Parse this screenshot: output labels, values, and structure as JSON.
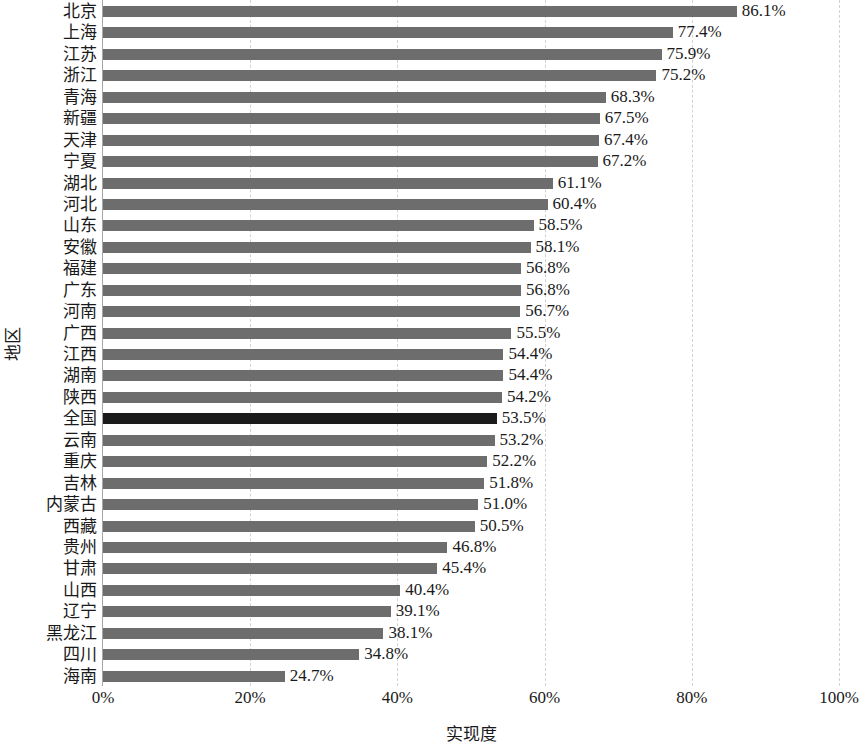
{
  "chart_data": {
    "type": "bar",
    "orientation": "horizontal",
    "title": "",
    "xlabel": "实现度",
    "ylabel": "地区",
    "xlim": [
      0,
      100
    ],
    "xticks": [
      "0%",
      "20%",
      "40%",
      "60%",
      "80%",
      "100%"
    ],
    "xtick_values": [
      0,
      20,
      40,
      60,
      80,
      100
    ],
    "grid": "vertical-dashed",
    "legend": null,
    "value_suffix": "%",
    "bar_color": "#6d6d6d",
    "highlight_color": "#1b1b1b",
    "highlight_category": "全国",
    "categories": [
      "北京",
      "上海",
      "江苏",
      "浙江",
      "青海",
      "新疆",
      "天津",
      "宁夏",
      "湖北",
      "河北",
      "山东",
      "安徽",
      "福建",
      "广东",
      "河南",
      "广西",
      "江西",
      "湖南",
      "陕西",
      "全国",
      "云南",
      "重庆",
      "吉林",
      "内蒙古",
      "西藏",
      "贵州",
      "甘肃",
      "山西",
      "辽宁",
      "黑龙江",
      "四川",
      "海南"
    ],
    "values": [
      86.1,
      77.4,
      75.9,
      75.2,
      68.3,
      67.5,
      67.4,
      67.2,
      61.1,
      60.4,
      58.5,
      58.1,
      56.8,
      56.8,
      56.7,
      55.5,
      54.4,
      54.4,
      54.2,
      53.5,
      53.2,
      52.2,
      51.8,
      51.0,
      50.5,
      46.8,
      45.4,
      40.4,
      39.1,
      38.1,
      34.8,
      24.7
    ],
    "labels": [
      "86.1%",
      "77.4%",
      "75.9%",
      "75.2%",
      "68.3%",
      "67.5%",
      "67.4%",
      "67.2%",
      "61.1%",
      "60.4%",
      "58.5%",
      "58.1%",
      "56.8%",
      "56.8%",
      "56.7%",
      "55.5%",
      "54.4%",
      "54.4%",
      "54.2%",
      "53.5%",
      "53.2%",
      "52.2%",
      "51.8%",
      "51.0%",
      "50.5%",
      "46.8%",
      "45.4%",
      "40.4%",
      "39.1%",
      "38.1%",
      "34.8%",
      "24.7%"
    ]
  }
}
